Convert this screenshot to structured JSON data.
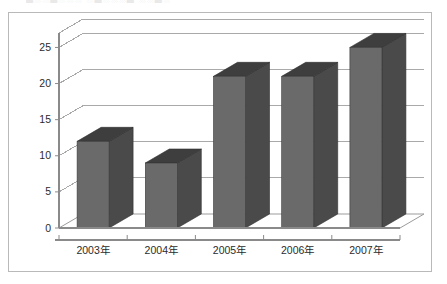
{
  "title_remnant": "█░░█░░░  ░█░░░█  ░░█░",
  "chart_data": {
    "type": "bar",
    "title": "",
    "xlabel": "",
    "ylabel": "",
    "categories": [
      "2003年",
      "2004年",
      "2005年",
      "2006年",
      "2007年"
    ],
    "values": [
      12,
      9,
      21,
      21,
      25
    ],
    "ylim": [
      0,
      27
    ],
    "yticks": [
      0,
      5,
      10,
      15,
      20,
      25
    ],
    "ytick_labels": [
      "0",
      "5",
      "10",
      "15",
      "20",
      "25"
    ],
    "grid": true,
    "legend": false,
    "legend_position": "none",
    "three_d": true,
    "series": [
      {
        "name": "series1",
        "values": [
          12,
          9,
          21,
          21,
          25
        ]
      }
    ]
  },
  "style": {
    "bar_front_color": "#6a6a6a",
    "bar_side_color": "#4a4a4a",
    "bar_top_color": "#3e3e3e",
    "gridline_color": "#a9a9a9",
    "axis_color": "#8a8a8a",
    "frame_border_color": "#b9b9b9",
    "background_color": "#ffffff",
    "text_color": "#2b2b2b"
  }
}
